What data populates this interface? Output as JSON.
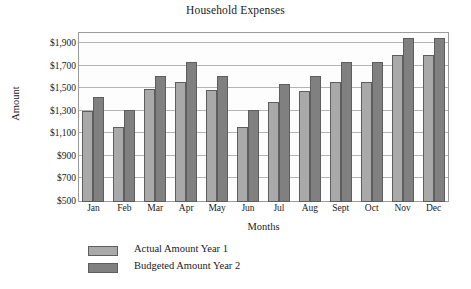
{
  "chart_data": {
    "type": "bar",
    "title": "Household Expenses",
    "xlabel": "Months",
    "ylabel": "Amount",
    "categories": [
      "Jan",
      "Feb",
      "Mar",
      "Apr",
      "May",
      "Jun",
      "Jul",
      "Aug",
      "Sept",
      "Oct",
      "Nov",
      "Dec"
    ],
    "series": [
      {
        "name": "Actual Amount Year 1",
        "color": "#a9a9a9",
        "values": [
          1305,
          1170,
          1500,
          1570,
          1495,
          1170,
          1390,
          1490,
          1570,
          1570,
          1810,
          1810
        ]
      },
      {
        "name": "Budgeted Amount Year 2",
        "color": "#808080",
        "values": [
          1430,
          1320,
          1620,
          1740,
          1620,
          1320,
          1545,
          1620,
          1740,
          1740,
          1960,
          1960
        ]
      }
    ],
    "ylim": [
      500,
      2010
    ],
    "yticks": [
      500,
      700,
      900,
      1100,
      1300,
      1500,
      1700,
      1900
    ],
    "ytick_labels": [
      "$500",
      "$700",
      "$900",
      "$1,100",
      "$1,300",
      "$1,500",
      "$1,700",
      "$1,900"
    ],
    "grid": true,
    "legend_position": "bottom-left",
    "bar_border_color": "#5e5e5e",
    "plot_border_color": "#9b9b9b",
    "gridline_color": "#b4b4b4"
  }
}
